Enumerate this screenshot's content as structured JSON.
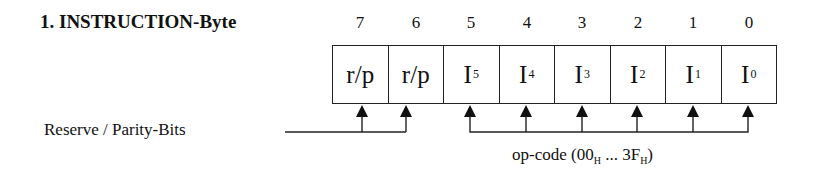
{
  "title": "1. INSTRUCTION-Byte",
  "bit_numbers": [
    "7",
    "6",
    "5",
    "4",
    "3",
    "2",
    "1",
    "0"
  ],
  "cells": [
    {
      "main": "r/p",
      "sub": ""
    },
    {
      "main": "r/p",
      "sub": ""
    },
    {
      "main": "I",
      "sub": "5"
    },
    {
      "main": "I",
      "sub": "4"
    },
    {
      "main": "I",
      "sub": "3"
    },
    {
      "main": "I",
      "sub": "2"
    },
    {
      "main": "I",
      "sub": "1"
    },
    {
      "main": "I",
      "sub": "0"
    }
  ],
  "reserve_label": "Reserve / Parity-Bits",
  "opcode_label": {
    "prefix": "op-code (00",
    "sub1": "H",
    "middle": " ... 3F",
    "sub2": "H",
    "suffix": ")"
  }
}
